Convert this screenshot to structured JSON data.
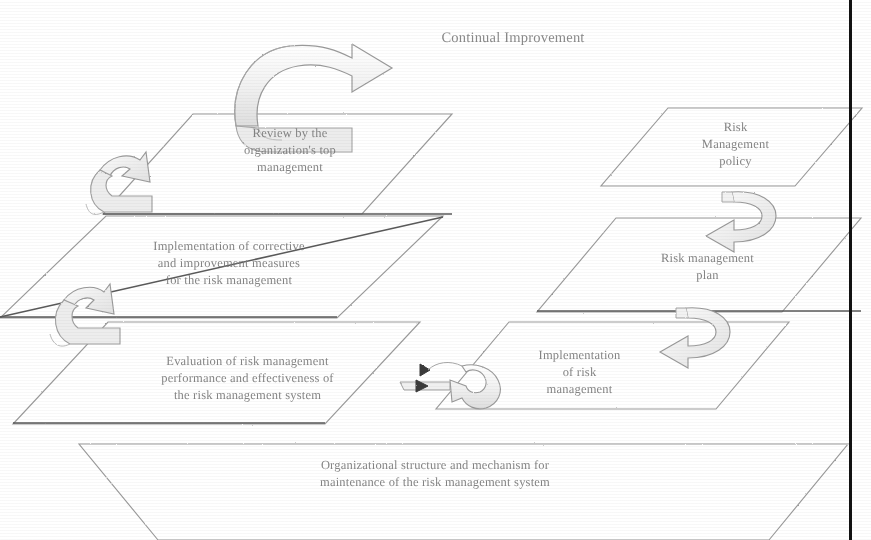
{
  "diagram": {
    "title": "Continual Improvement",
    "planes": [
      {
        "id": "review",
        "label": "Review by the\norganization's top\nmanagement"
      },
      {
        "id": "policy",
        "label": "Risk\nManagement\npolicy"
      },
      {
        "id": "corrective",
        "label": "Implementation of corrective\nand improvement measures\nfor the risk management"
      },
      {
        "id": "plan",
        "label": "Risk management\nplan"
      },
      {
        "id": "evaluation",
        "label": "Evaluation of risk management\nperformance and effectiveness of\nthe risk management system"
      },
      {
        "id": "implement",
        "label": "Implementation\nof risk\nmanagement"
      },
      {
        "id": "organizational",
        "label": "Organizational structure and mechanism for\nmaintenance of the risk management system"
      }
    ],
    "arrows": [
      {
        "id": "continual-improvement-arrow",
        "direction": "right"
      },
      {
        "id": "review-to-corrective-arrow",
        "direction": "down-left"
      },
      {
        "id": "corrective-to-evaluation-arrow",
        "direction": "down-left"
      },
      {
        "id": "policy-to-plan-arrow",
        "direction": "down-left"
      },
      {
        "id": "plan-to-implementation-arrow",
        "direction": "down-left"
      },
      {
        "id": "implementation-to-evaluation-arrow",
        "direction": "left"
      }
    ],
    "colors": {
      "line": "#8c8c8c",
      "text": "#7a7a7a",
      "border": "#121212",
      "background": "#ffffff"
    }
  }
}
